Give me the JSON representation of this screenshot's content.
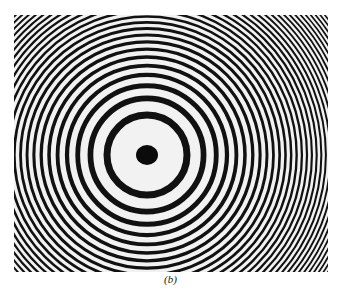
{
  "figure": {
    "caption": "(b)",
    "center": {
      "x": 147,
      "y": 155
    },
    "central_spot_radius": 10,
    "first_ring_radius": 40,
    "ring_count": 60,
    "ring_dark_color": "#111111",
    "ring_light_color": "#f2f2f2"
  }
}
